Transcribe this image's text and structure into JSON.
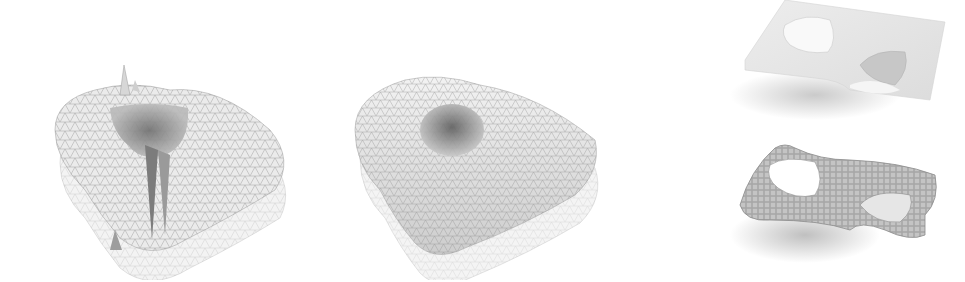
{
  "figure": {
    "panels": [
      {
        "id": "noisy-mesh",
        "description": "triangulated surface with spikes (noisy reconstruction)"
      },
      {
        "id": "smooth-mesh",
        "description": "smoothed triangulated surface"
      },
      {
        "id": "surface-top",
        "description": "smooth shaded surface with two holes"
      },
      {
        "id": "quad-mesh",
        "description": "quad-meshed surface with two holes"
      }
    ],
    "colors": {
      "background": "#ffffff",
      "mesh_line": "#8a8a8a",
      "surface": "#e6e6e6",
      "shadow": "#cfcfcf"
    }
  }
}
